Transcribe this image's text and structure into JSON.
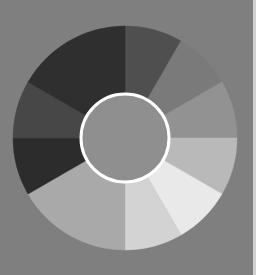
{
  "image": {
    "width": 256,
    "height": 275,
    "background": "#7f7f7f",
    "edge_strip_color": "#cfcfcf"
  },
  "wheel": {
    "center_x": 125,
    "center_y": 138,
    "outer_radius": 112,
    "segments": [
      {
        "start": 0,
        "end": 30,
        "color": "#4f4f4f"
      },
      {
        "start": 30,
        "end": 60,
        "color": "#7a7a7a"
      },
      {
        "start": 60,
        "end": 90,
        "color": "#929292"
      },
      {
        "start": 90,
        "end": 120,
        "color": "#b9b9b9"
      },
      {
        "start": 120,
        "end": 150,
        "color": "#e9e9e9"
      },
      {
        "start": 150,
        "end": 180,
        "color": "#d3d3d3"
      },
      {
        "start": 180,
        "end": 240,
        "color": "#a9a9a9"
      },
      {
        "start": 240,
        "end": 270,
        "color": "#2c2c2c"
      },
      {
        "start": 270,
        "end": 300,
        "color": "#474747"
      },
      {
        "start": 300,
        "end": 360,
        "color": "#2f2f2f"
      }
    ],
    "center_circle": {
      "radius": 44,
      "fill": "#8f8f8f",
      "stroke": "#ffffff",
      "stroke_width": 3
    }
  }
}
